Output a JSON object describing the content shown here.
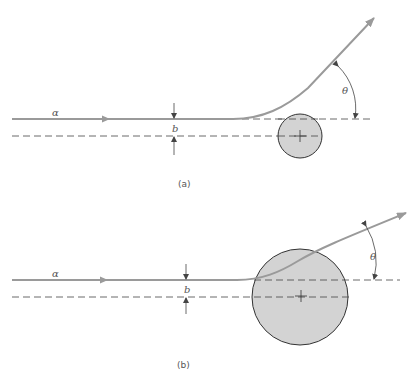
{
  "panels": [
    {
      "id": "a",
      "caption": "(a)",
      "particle_label": "α",
      "impact_parameter_label": "b",
      "angle_label": "θ",
      "nucleus": {
        "cx": 300,
        "cy": 136,
        "r": 22
      }
    },
    {
      "id": "b",
      "caption": "(b)",
      "particle_label": "α",
      "impact_parameter_label": "b",
      "angle_label": "θ",
      "nucleus": {
        "cx": 300,
        "cy": 297,
        "r": 48
      }
    }
  ],
  "colors": {
    "trajectory": "#9a9a9a",
    "nucleus_fill": "#d3d3d3",
    "nucleus_stroke": "#333333",
    "dashed": "#444444",
    "marker": "#444444"
  }
}
